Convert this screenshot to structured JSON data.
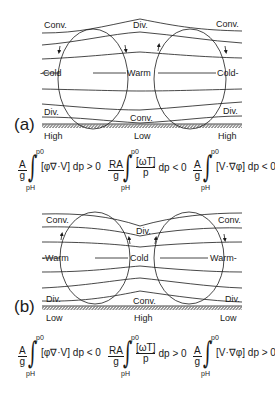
{
  "figure": {
    "panel_a": {
      "label": "(a)",
      "top_labels": [
        "Conv.",
        "Div.",
        "Conv."
      ],
      "mid_labels": [
        "-Cold",
        "Warm",
        "Cold-"
      ],
      "bottom_labels": [
        "Div.",
        "Conv.",
        "Div."
      ],
      "ground_labels": [
        "High",
        "Low",
        "High"
      ],
      "equations": [
        {
          "prefix_num": "A",
          "prefix_den": "g",
          "upper": "p0",
          "lower": "pH",
          "integrand": "[φ∇·V] dp > 0"
        },
        {
          "prefix_num": "RA",
          "prefix_den": "g",
          "upper": "p0",
          "lower": "pH",
          "integrand_num": "[ωT]",
          "integrand_den": "p",
          "tail": "dp < 0"
        },
        {
          "prefix_num": "A",
          "prefix_den": "g",
          "upper": "p0",
          "lower": "pH",
          "integrand": "[V·∇φ] dp < 0"
        }
      ]
    },
    "panel_b": {
      "label": "(b)",
      "top_labels": [
        "Conv.",
        "Div.",
        "Conv."
      ],
      "mid_labels": [
        "-Warm",
        "Cold",
        "Warm-"
      ],
      "bottom_labels": [
        "Div.",
        "Conv.",
        "Div."
      ],
      "ground_labels": [
        "Low",
        "High",
        "Low"
      ],
      "equations": [
        {
          "prefix_num": "A",
          "prefix_den": "g",
          "upper": "p0",
          "lower": "pH",
          "integrand": "[φ∇·V] dp < 0"
        },
        {
          "prefix_num": "RA",
          "prefix_den": "g",
          "upper": "p0",
          "lower": "pH",
          "integrand_num": "[ωT]",
          "integrand_den": "p",
          "tail": "dp > 0"
        },
        {
          "prefix_num": "A",
          "prefix_den": "g",
          "upper": "p0",
          "lower": "pH",
          "integrand": "[V·∇φ] dp > 0"
        }
      ]
    }
  }
}
